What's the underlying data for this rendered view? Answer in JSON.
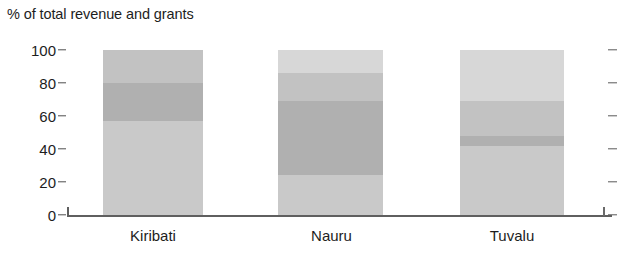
{
  "chart_data": {
    "type": "bar",
    "subtype": "stacked-bar",
    "title": "% of total revenue and grants",
    "xlabel": "",
    "ylabel": "% of total revenue and grants",
    "ylim": [
      0,
      100
    ],
    "yticks": [
      0,
      20,
      40,
      60,
      80,
      100
    ],
    "ytick_labels": [
      "0",
      "20",
      "40",
      "60",
      "80",
      "100"
    ],
    "grid": false,
    "legend": "none",
    "right_axis_ticks": true,
    "categories": [
      "Kiribati",
      "Nauru",
      "Tuvalu"
    ],
    "stack_order": "bottom-to-top",
    "series": [
      {
        "name": "segment-1",
        "color": "#c9c9c9",
        "values": [
          57,
          24,
          42
        ]
      },
      {
        "name": "segment-2",
        "color": "#b0b0b0",
        "values": [
          23,
          45,
          6
        ]
      },
      {
        "name": "segment-3",
        "color": "#c2c2c2",
        "values": [
          20,
          17,
          21
        ]
      },
      {
        "name": "segment-4",
        "color": "#d7d7d7",
        "values": [
          0,
          14,
          31
        ]
      }
    ],
    "bar_totals": [
      100,
      100,
      100
    ],
    "boundaries": {
      "Kiribati": [
        57,
        80,
        100
      ],
      "Nauru": [
        24,
        69,
        86,
        100
      ],
      "Tuvalu": [
        42,
        48,
        69,
        100
      ]
    }
  },
  "axis": {
    "title": "% of total revenue and grants",
    "tick_100": "100",
    "tick_80": "80",
    "tick_60": "60",
    "tick_40": "40",
    "tick_20": "20",
    "tick_0": "0"
  },
  "categories": {
    "kiribati": "Kiribati",
    "nauru": "Nauru",
    "tuvalu": "Tuvalu"
  },
  "colors": {
    "segment_light": "#d7d7d7",
    "segment_mid_light": "#c9c9c9",
    "segment_mid": "#c2c2c2",
    "segment_dark": "#b0b0b0",
    "axis": "#5f5f5f",
    "text": "#1d1d1d",
    "divider": "#8e8e8e"
  }
}
